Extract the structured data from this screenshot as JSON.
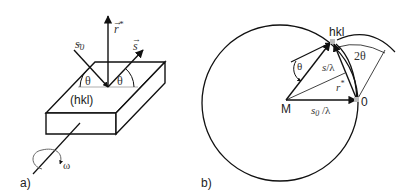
{
  "panel_a": {
    "label": "a)",
    "plane_label": "(hkl)",
    "vectors": {
      "incident": "s",
      "incident_sub": "0",
      "diffracted": "s",
      "reciprocal": "r",
      "reciprocal_sup": "*"
    },
    "angle_left": "θ",
    "angle_right": "θ",
    "rotation": "ω"
  },
  "panel_b": {
    "label": "b)",
    "point_hkl": "hkl",
    "point_M": "M",
    "point_origin": "0",
    "angle_theta": "θ",
    "angle_2theta": "2θ",
    "vector_s": "s",
    "vector_s_suffix": "/λ",
    "vector_s0": "s",
    "vector_s0_sub": "0",
    "vector_s0_suffix": " /λ",
    "vector_r": "r",
    "vector_r_sup": "*"
  },
  "colors": {
    "stroke": "#111111",
    "point": "#bbbbbb"
  }
}
